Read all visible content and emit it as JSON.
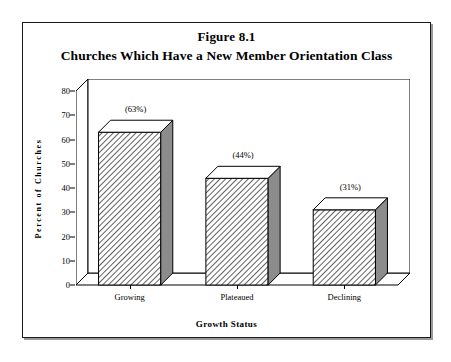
{
  "figure": {
    "number": "Figure 8.1",
    "title": "Churches Which Have a New Member Orientation Class"
  },
  "chart_data": {
    "type": "bar",
    "title": "Churches Which Have a New Member Orientation Class",
    "subtitle": "Figure 8.1",
    "xlabel": "Growth Status",
    "ylabel": "Percent of Churches",
    "categories": [
      "Growing",
      "Plateaued",
      "Declining"
    ],
    "values": [
      63,
      44,
      31
    ],
    "data_labels": [
      "(63%)",
      "(44%)",
      "(31%)"
    ],
    "ylim": [
      0,
      80
    ],
    "yticks": [
      0,
      10,
      20,
      30,
      40,
      50,
      60,
      70,
      80
    ],
    "ytick_labels": [
      "0",
      "10",
      "20",
      "30",
      "40",
      "50",
      "60",
      "70",
      "80"
    ],
    "grid": false,
    "legend": false,
    "style": "3d-bar-hatched",
    "colors": {
      "bar_front_fill": "#ffffff",
      "bar_hatch": "#404040",
      "bar_side": "#8c8c8c",
      "bar_top": "#ffffff",
      "outline": "#000000",
      "background": "#ffffff"
    }
  }
}
